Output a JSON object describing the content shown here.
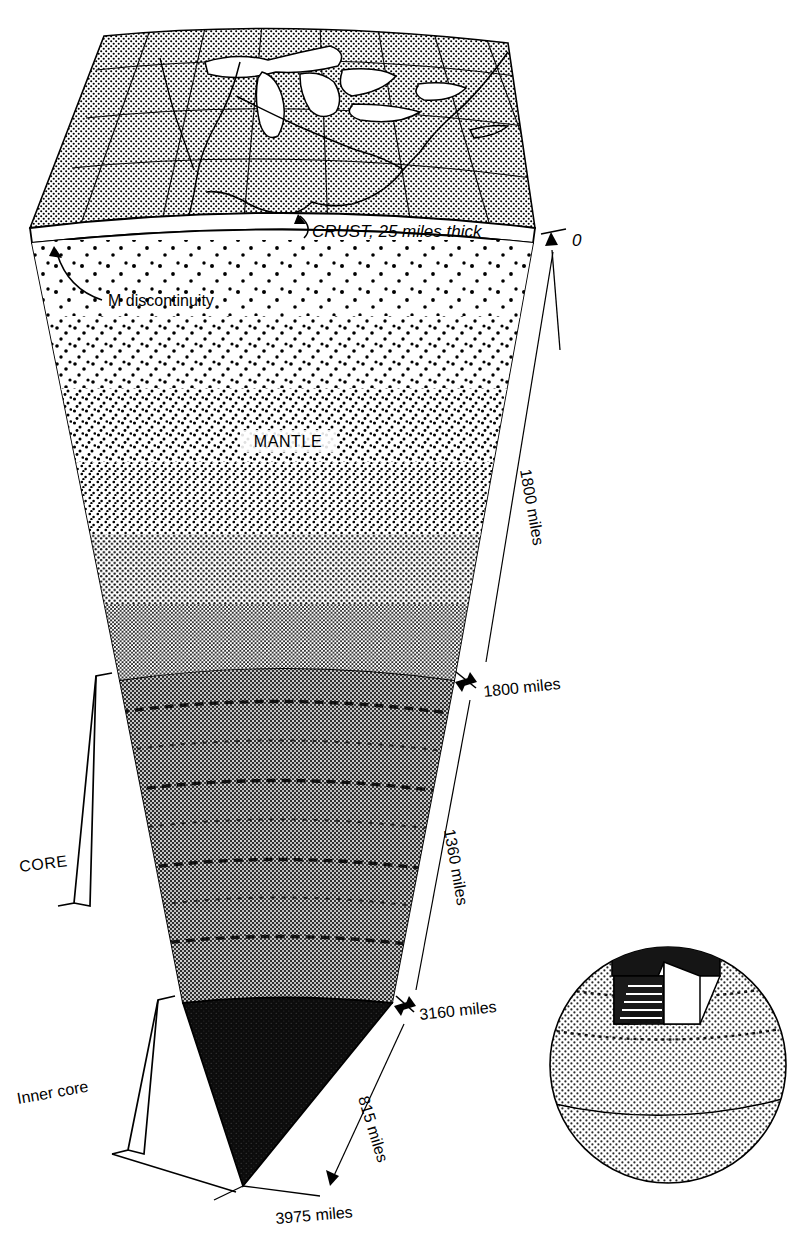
{
  "figure": {
    "labels": {
      "crust": "CRUST, 25 miles thick",
      "m_discontinuity": "M discontinuity",
      "mantle": "MANTLE",
      "core": "CORE",
      "inner_core": "Inner core",
      "zero": "0"
    },
    "depth_markers": [
      {
        "id": "surface",
        "text": "0",
        "depth_miles": 0
      },
      {
        "id": "mantle-base",
        "text": "1800 miles",
        "depth_miles": 1800
      },
      {
        "id": "outer-core-base",
        "text": "3160 miles",
        "depth_miles": 3160
      },
      {
        "id": "center",
        "text": "3975 miles",
        "depth_miles": 3975
      }
    ],
    "span_labels": [
      {
        "id": "mantle-thickness",
        "text": "1800 miles",
        "value_miles": 1800
      },
      {
        "id": "outer-core-thickness",
        "text": "1360 miles",
        "value_miles": 1360
      },
      {
        "id": "inner-core-radius",
        "text": "815 miles",
        "value_miles": 815
      }
    ],
    "layers": [
      {
        "name": "CRUST",
        "thickness_miles": 25,
        "top_depth_miles": 0,
        "bottom_depth_miles": 25,
        "pattern": "fine-stipple-map"
      },
      {
        "name": "MANTLE",
        "thickness_miles": 1775,
        "top_depth_miles": 25,
        "bottom_depth_miles": 1800,
        "pattern": "graded-stipple"
      },
      {
        "name": "OUTER CORE",
        "thickness_miles": 1360,
        "top_depth_miles": 1800,
        "bottom_depth_miles": 3160,
        "pattern": "dark-crosshatch"
      },
      {
        "name": "INNER CORE",
        "thickness_miles": 815,
        "top_depth_miles": 3160,
        "bottom_depth_miles": 3975,
        "pattern": "solid-black"
      }
    ],
    "inset": {
      "name": "globe-key",
      "description": "Small stippled globe with a dark wedge removed showing where the cross-section is taken"
    },
    "colors": {
      "ink": "#000000",
      "paper": "#ffffff",
      "crust_fill": "#d8d8d8",
      "outer_core_fill": "#3c3c3c",
      "inner_core_fill": "#111111",
      "globe_fill": "#dedede"
    }
  }
}
